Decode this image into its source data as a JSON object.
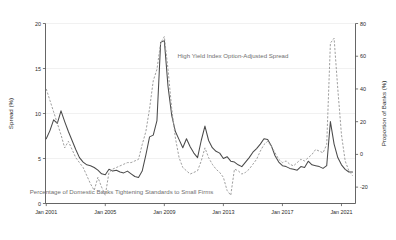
{
  "chart_data": {
    "type": "line",
    "title": "",
    "subtitle": "",
    "grid": "horizontal",
    "legend_position": "inline-annotations",
    "xlabel": "",
    "ylabel": "Spread (%)",
    "y2label": "Proportion of Banks (%)",
    "xlim": [
      "2001-01",
      "2021-10"
    ],
    "ylim": [
      0,
      20
    ],
    "y2lim": [
      -30,
      80
    ],
    "xticks": [
      "Jan 2001",
      "Jan 2005",
      "Jan 2009",
      "Jan 2013",
      "Jan 2017",
      "Jan 2021"
    ],
    "xtick_positions": [
      2001.0,
      2005.0,
      2009.0,
      2013.0,
      2017.0,
      2021.0
    ],
    "yticks": [
      0,
      5,
      10,
      15,
      20
    ],
    "y2ticks": [
      -20,
      0,
      20,
      40,
      60,
      80
    ],
    "annotations": [
      {
        "text": "High Yield Index Option-Adjusted Spread",
        "x": 2009.9,
        "y": 16.2,
        "anchor": "start",
        "color": "#6f6f6f"
      },
      {
        "text": "Percentage of Domestic Banks Tightening Standards to Small Firms",
        "x": 2006.1,
        "y": 1.05,
        "anchor": "middle",
        "color": "#8d8d8d"
      }
    ],
    "series": [
      {
        "name": "High Yield Index Option-Adjusted Spread",
        "axis": "left",
        "style": "solid",
        "color": "#4a4a4a",
        "unit": "%",
        "x": [
          2001.0,
          2001.25,
          2001.5,
          2001.75,
          2002.0,
          2002.25,
          2002.5,
          2002.75,
          2003.0,
          2003.25,
          2003.5,
          2003.75,
          2004.0,
          2004.25,
          2004.5,
          2004.75,
          2005.0,
          2005.25,
          2005.5,
          2005.75,
          2006.0,
          2006.25,
          2006.5,
          2006.75,
          2007.0,
          2007.25,
          2007.5,
          2007.75,
          2008.0,
          2008.25,
          2008.5,
          2008.75,
          2009.0,
          2009.25,
          2009.5,
          2009.75,
          2010.0,
          2010.25,
          2010.5,
          2010.75,
          2011.0,
          2011.25,
          2011.5,
          2011.75,
          2012.0,
          2012.25,
          2012.5,
          2012.75,
          2013.0,
          2013.25,
          2013.5,
          2013.75,
          2014.0,
          2014.25,
          2014.5,
          2014.75,
          2015.0,
          2015.25,
          2015.5,
          2015.75,
          2016.0,
          2016.25,
          2016.5,
          2016.75,
          2017.0,
          2017.25,
          2017.5,
          2017.75,
          2018.0,
          2018.25,
          2018.5,
          2018.75,
          2019.0,
          2019.25,
          2019.5,
          2019.75,
          2020.0,
          2020.25,
          2020.5,
          2020.75,
          2021.0,
          2021.25,
          2021.5,
          2021.75
        ],
        "values": [
          7.2,
          8.1,
          9.3,
          8.9,
          10.3,
          9.1,
          8.0,
          7.0,
          6.0,
          5.1,
          4.6,
          4.3,
          4.2,
          4.0,
          3.7,
          3.3,
          3.2,
          3.8,
          3.6,
          3.7,
          3.5,
          3.4,
          3.6,
          3.3,
          3.0,
          2.9,
          3.6,
          5.4,
          7.4,
          7.6,
          9.2,
          17.9,
          18.1,
          13.0,
          9.8,
          8.0,
          7.1,
          6.2,
          7.2,
          6.3,
          5.6,
          5.1,
          7.0,
          8.6,
          7.0,
          6.2,
          5.8,
          5.6,
          5.0,
          5.2,
          4.7,
          4.6,
          4.3,
          4.1,
          4.6,
          5.1,
          5.7,
          6.1,
          6.6,
          7.2,
          7.1,
          6.4,
          5.3,
          4.6,
          4.2,
          4.1,
          3.9,
          3.8,
          3.7,
          4.1,
          4.0,
          4.7,
          4.3,
          4.2,
          4.1,
          3.9,
          4.2,
          9.1,
          6.6,
          5.1,
          4.3,
          3.8,
          3.5,
          3.5
        ]
      },
      {
        "name": "Percentage of Domestic Banks Tightening Standards to Small Firms",
        "axis": "right",
        "style": "dashed",
        "color": "#9a9a9a",
        "unit": "%",
        "x": [
          2001.0,
          2001.25,
          2001.5,
          2001.75,
          2002.0,
          2002.25,
          2002.5,
          2002.75,
          2003.0,
          2003.25,
          2003.5,
          2003.75,
          2004.0,
          2004.25,
          2004.5,
          2004.75,
          2005.0,
          2005.25,
          2005.5,
          2005.75,
          2006.0,
          2006.25,
          2006.5,
          2006.75,
          2007.0,
          2007.25,
          2007.5,
          2007.75,
          2008.0,
          2008.25,
          2008.5,
          2008.75,
          2009.0,
          2009.25,
          2009.5,
          2009.75,
          2010.0,
          2010.25,
          2010.5,
          2010.75,
          2011.0,
          2011.25,
          2011.5,
          2011.75,
          2012.0,
          2012.25,
          2012.5,
          2012.75,
          2013.0,
          2013.25,
          2013.5,
          2013.75,
          2014.0,
          2014.25,
          2014.5,
          2014.75,
          2015.0,
          2015.25,
          2015.5,
          2015.75,
          2016.0,
          2016.25,
          2016.5,
          2016.75,
          2017.0,
          2017.25,
          2017.5,
          2017.75,
          2018.0,
          2018.25,
          2018.5,
          2018.75,
          2019.0,
          2019.25,
          2019.5,
          2019.75,
          2020.0,
          2020.25,
          2020.5,
          2020.75,
          2021.0,
          2021.25,
          2021.5,
          2021.75
        ],
        "values": [
          40.0,
          33.0,
          26.0,
          19.0,
          12.0,
          4.0,
          8.0,
          3.0,
          -2.0,
          -5.0,
          -8.0,
          -13.0,
          -18.0,
          -22.0,
          -14.0,
          -20.0,
          -25.0,
          -11.0,
          -9.0,
          -8.0,
          -7.0,
          -6.0,
          -5.0,
          -5.0,
          -4.0,
          -3.0,
          6.0,
          14.0,
          28.0,
          45.0,
          52.0,
          68.0,
          72.0,
          52.0,
          28.0,
          10.0,
          -2.0,
          -8.0,
          -10.0,
          -12.0,
          -11.0,
          -10.0,
          -4.0,
          4.0,
          -2.0,
          -6.0,
          -9.0,
          -11.0,
          -14.0,
          -22.0,
          -25.0,
          -9.0,
          -10.0,
          -12.0,
          -11.0,
          -9.0,
          -6.0,
          -3.0,
          2.0,
          6.0,
          8.0,
          5.0,
          1.0,
          -3.0,
          -5.0,
          -4.0,
          -6.0,
          -7.0,
          -5.0,
          -3.0,
          -4.0,
          -2.0,
          0.0,
          3.0,
          2.0,
          1.0,
          6.0,
          68.0,
          71.0,
          40.0,
          12.0,
          -4.0,
          -10.0,
          -13.0
        ]
      }
    ]
  },
  "axes": {
    "left_title": "Spread (%)",
    "right_title": "Proportion of Banks (%)",
    "left_tick_labels": [
      "0",
      "5",
      "10",
      "15",
      "20"
    ],
    "right_tick_labels": [
      "-20",
      "0",
      "20",
      "40",
      "60",
      "80"
    ],
    "x_tick_labels": [
      "Jan 2001",
      "Jan 2005",
      "Jan 2009",
      "Jan 2013",
      "Jan 2017",
      "Jan 2021"
    ]
  },
  "colors": {
    "background": "#ffffff",
    "frame": "#555555",
    "grid": "#e8e8e8",
    "solid_series": "#4a4a4a",
    "dashed_series": "#9a9a9a",
    "annotation_primary": "#6f6f6f",
    "annotation_secondary": "#8d8d8d",
    "tick_text": "#2a2a2a"
  }
}
